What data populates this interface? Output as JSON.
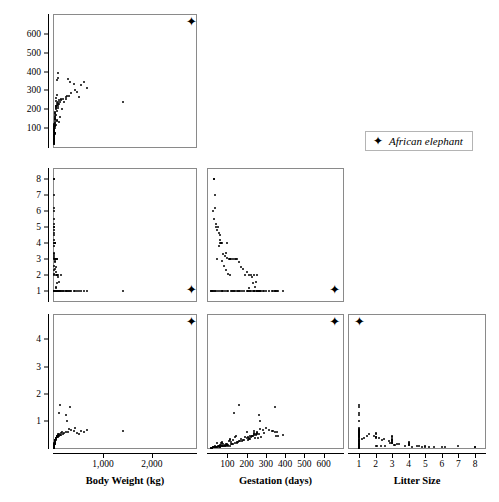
{
  "figure": {
    "type": "scatterplot-matrix",
    "legend": {
      "marker": "star-marker",
      "label": "African elephant"
    }
  },
  "variables": {
    "body_weight": {
      "label": "Body Weight (kg)",
      "ticks": [
        "1,000",
        "2,000"
      ],
      "tick_values": [
        1000,
        2000
      ],
      "range": [
        0,
        2900
      ]
    },
    "gestation": {
      "label": "Gestation (days)",
      "ticks": [
        "100",
        "200",
        "300",
        "400",
        "500",
        "600"
      ],
      "tick_values": [
        100,
        200,
        300,
        400,
        500,
        600
      ],
      "range": [
        0,
        700
      ]
    },
    "litter_size": {
      "label": "Litter Size",
      "ticks": [
        "1",
        "2",
        "3",
        "4",
        "5",
        "6",
        "7",
        "8"
      ],
      "tick_values": [
        1,
        2,
        3,
        4,
        5,
        6,
        7,
        8
      ],
      "range": [
        0.4,
        8.6
      ]
    },
    "brain_weight": {
      "label": "Brain Weight (g)",
      "ticks": [
        "1",
        "2",
        "3",
        "4"
      ],
      "tick_values": [
        1,
        2,
        3,
        4
      ],
      "range": [
        0,
        4.9
      ]
    }
  },
  "chart_data": {
    "type": "scatter",
    "title": "",
    "grid": false,
    "legend_position": "top-right",
    "panels": [
      {
        "name": "gestation-vs-bodyweight",
        "row": 0,
        "col": 0,
        "x": "body_weight",
        "y": "gestation",
        "xlabel": "Body Weight (kg)",
        "ylabel": "Gestation (days)"
      },
      {
        "name": "littersize-vs-bodyweight",
        "row": 1,
        "col": 0,
        "x": "body_weight",
        "y": "litter_size",
        "xlabel": "Body Weight (kg)",
        "ylabel": "Litter Size"
      },
      {
        "name": "littersize-vs-gestation",
        "row": 1,
        "col": 1,
        "x": "gestation",
        "y": "litter_size",
        "xlabel": "Gestation (days)",
        "ylabel": "Litter Size"
      },
      {
        "name": "brainweight-vs-bodyweight",
        "row": 2,
        "col": 0,
        "x": "body_weight",
        "y": "brain_weight",
        "xlabel": "Body Weight (kg)",
        "ylabel": "Brain Weight (g)"
      },
      {
        "name": "brainweight-vs-gestation",
        "row": 2,
        "col": 1,
        "x": "gestation",
        "y": "brain_weight",
        "xlabel": "Gestation (days)",
        "ylabel": "Brain Weight (g)"
      },
      {
        "name": "brainweight-vs-littersize",
        "row": 2,
        "col": 2,
        "x": "litter_size",
        "y": "brain_weight",
        "xlabel": "Litter Size",
        "ylabel": "Brain Weight (g)"
      }
    ],
    "highlight": {
      "label": "African elephant",
      "body_weight": 2800,
      "gestation": 655,
      "litter_size": 1,
      "brain_weight": 4.6
    },
    "observations": [
      {
        "body_weight": 6.8,
        "gestation": 45,
        "litter_size": 3,
        "brain_weight": 0.18
      },
      {
        "body_weight": 1.0,
        "gestation": 33,
        "litter_size": 8,
        "brain_weight": 0.04
      },
      {
        "body_weight": 3.4,
        "gestation": 38,
        "litter_size": 7,
        "brain_weight": 0.06
      },
      {
        "body_weight": 2.0,
        "gestation": 28,
        "litter_size": 6,
        "brain_weight": 0.03
      },
      {
        "body_weight": 1.7,
        "gestation": 31,
        "litter_size": 5.5,
        "brain_weight": 0.03
      },
      {
        "body_weight": 2.4,
        "gestation": 42,
        "litter_size": 5,
        "brain_weight": 0.05
      },
      {
        "body_weight": 2.6,
        "gestation": 50,
        "litter_size": 5,
        "brain_weight": 0.07
      },
      {
        "body_weight": 4.1,
        "gestation": 56,
        "litter_size": 4.6,
        "brain_weight": 0.08
      },
      {
        "body_weight": 3.8,
        "gestation": 60,
        "litter_size": 4.5,
        "brain_weight": 0.07
      },
      {
        "body_weight": 9.0,
        "gestation": 63,
        "litter_size": 4,
        "brain_weight": 0.12
      },
      {
        "body_weight": 14.0,
        "gestation": 68,
        "litter_size": 4,
        "brain_weight": 0.17
      },
      {
        "body_weight": 22.0,
        "gestation": 72,
        "litter_size": 4,
        "brain_weight": 0.22
      },
      {
        "body_weight": 6.0,
        "gestation": 66,
        "litter_size": 4,
        "brain_weight": 0.1
      },
      {
        "body_weight": 11.0,
        "gestation": 100,
        "litter_size": 4,
        "brain_weight": 0.14
      },
      {
        "body_weight": 5.2,
        "gestation": 58,
        "litter_size": 3.8,
        "brain_weight": 0.09
      },
      {
        "body_weight": 8.5,
        "gestation": 95,
        "litter_size": 3.4,
        "brain_weight": 0.13
      },
      {
        "body_weight": 18.0,
        "gestation": 110,
        "litter_size": 3,
        "brain_weight": 0.25
      },
      {
        "body_weight": 30.0,
        "gestation": 112,
        "litter_size": 3,
        "brain_weight": 0.3
      },
      {
        "body_weight": 42.0,
        "gestation": 115,
        "litter_size": 3,
        "brain_weight": 0.34
      },
      {
        "body_weight": 16.0,
        "gestation": 120,
        "litter_size": 3,
        "brain_weight": 0.21
      },
      {
        "body_weight": 25.0,
        "gestation": 130,
        "litter_size": 3,
        "brain_weight": 0.28
      },
      {
        "body_weight": 55.0,
        "gestation": 138,
        "litter_size": 3,
        "brain_weight": 0.4
      },
      {
        "body_weight": 70.0,
        "gestation": 145,
        "litter_size": 3,
        "brain_weight": 0.44
      },
      {
        "body_weight": 12.0,
        "gestation": 150,
        "litter_size": 3,
        "brain_weight": 0.2
      },
      {
        "body_weight": 20.0,
        "gestation": 160,
        "litter_size": 2.8,
        "brain_weight": 0.26
      },
      {
        "body_weight": 33.0,
        "gestation": 170,
        "litter_size": 2.5,
        "brain_weight": 0.33
      },
      {
        "body_weight": 28.0,
        "gestation": 180,
        "litter_size": 2.4,
        "brain_weight": 0.31
      },
      {
        "body_weight": 48.0,
        "gestation": 200,
        "litter_size": 2.2,
        "brain_weight": 0.38
      },
      {
        "body_weight": 60.0,
        "gestation": 225,
        "litter_size": 2,
        "brain_weight": 0.42
      },
      {
        "body_weight": 90.0,
        "gestation": 240,
        "litter_size": 2,
        "brain_weight": 0.5
      },
      {
        "body_weight": 150.0,
        "gestation": 255,
        "litter_size": 2,
        "brain_weight": 0.55
      },
      {
        "body_weight": 38.0,
        "gestation": 210,
        "litter_size": 2,
        "brain_weight": 0.36
      },
      {
        "body_weight": 52.0,
        "gestation": 190,
        "litter_size": 2,
        "brain_weight": 0.39
      },
      {
        "body_weight": 78.0,
        "gestation": 230,
        "litter_size": 1.9,
        "brain_weight": 0.46
      },
      {
        "body_weight": 110.0,
        "gestation": 250,
        "litter_size": 1.6,
        "brain_weight": 0.52
      },
      {
        "body_weight": 65.0,
        "gestation": 235,
        "litter_size": 1.5,
        "brain_weight": 0.43
      },
      {
        "body_weight": 45.0,
        "gestation": 245,
        "litter_size": 1.3,
        "brain_weight": 0.37
      },
      {
        "body_weight": 35.0,
        "gestation": 215,
        "litter_size": 1.2,
        "brain_weight": 0.32
      },
      {
        "body_weight": 100.0,
        "gestation": 135,
        "litter_size": 1,
        "brain_weight": 1.3
      },
      {
        "body_weight": 130.0,
        "gestation": 160,
        "litter_size": 1,
        "brain_weight": 1.6
      },
      {
        "body_weight": 170.0,
        "gestation": 200,
        "litter_size": 1,
        "brain_weight": 0.6
      },
      {
        "body_weight": 200.0,
        "gestation": 240,
        "litter_size": 1,
        "brain_weight": 0.55
      },
      {
        "body_weight": 250.0,
        "gestation": 255,
        "litter_size": 1,
        "brain_weight": 0.6
      },
      {
        "body_weight": 300.0,
        "gestation": 270,
        "litter_size": 1,
        "brain_weight": 0.7
      },
      {
        "body_weight": 340.0,
        "gestation": 285,
        "litter_size": 1,
        "brain_weight": 0.66
      },
      {
        "body_weight": 420.0,
        "gestation": 300,
        "litter_size": 1,
        "brain_weight": 0.75
      },
      {
        "body_weight": 460.0,
        "gestation": 290,
        "litter_size": 1,
        "brain_weight": 0.55
      },
      {
        "body_weight": 520.0,
        "gestation": 265,
        "litter_size": 1,
        "brain_weight": 0.5
      },
      {
        "body_weight": 560.0,
        "gestation": 330,
        "litter_size": 1,
        "brain_weight": 0.62
      },
      {
        "body_weight": 620.0,
        "gestation": 345,
        "litter_size": 1,
        "brain_weight": 0.58
      },
      {
        "body_weight": 1400.0,
        "gestation": 240,
        "litter_size": 1,
        "brain_weight": 0.62
      },
      {
        "body_weight": 680.0,
        "gestation": 315,
        "litter_size": 1,
        "brain_weight": 0.68
      },
      {
        "body_weight": 85.0,
        "gestation": 390,
        "litter_size": 1,
        "brain_weight": 0.48
      },
      {
        "body_weight": 75.0,
        "gestation": 365,
        "litter_size": 1,
        "brain_weight": 0.45
      },
      {
        "body_weight": 62.0,
        "gestation": 355,
        "litter_size": 1,
        "brain_weight": 0.44
      },
      {
        "body_weight": 58.0,
        "gestation": 275,
        "litter_size": 1,
        "brain_weight": 0.41
      },
      {
        "body_weight": 50.0,
        "gestation": 260,
        "litter_size": 1,
        "brain_weight": 0.38
      },
      {
        "body_weight": 40.0,
        "gestation": 220,
        "litter_size": 1,
        "brain_weight": 0.35
      },
      {
        "body_weight": 31.0,
        "gestation": 205,
        "litter_size": 1,
        "brain_weight": 0.31
      },
      {
        "body_weight": 27.0,
        "gestation": 185,
        "litter_size": 1,
        "brain_weight": 0.29
      },
      {
        "body_weight": 23.0,
        "gestation": 175,
        "litter_size": 1,
        "brain_weight": 0.27
      },
      {
        "body_weight": 19.0,
        "gestation": 165,
        "litter_size": 1,
        "brain_weight": 0.24
      },
      {
        "body_weight": 17.0,
        "gestation": 155,
        "litter_size": 1,
        "brain_weight": 0.23
      },
      {
        "body_weight": 15.0,
        "gestation": 148,
        "litter_size": 1,
        "brain_weight": 0.21
      },
      {
        "body_weight": 13.0,
        "gestation": 142,
        "litter_size": 1,
        "brain_weight": 0.19
      },
      {
        "body_weight": 10.5,
        "gestation": 128,
        "litter_size": 1,
        "brain_weight": 0.16
      },
      {
        "body_weight": 9.5,
        "gestation": 122,
        "litter_size": 1,
        "brain_weight": 0.15
      },
      {
        "body_weight": 8.0,
        "gestation": 118,
        "litter_size": 1,
        "brain_weight": 0.13
      },
      {
        "body_weight": 7.2,
        "gestation": 105,
        "litter_size": 1,
        "brain_weight": 0.12
      },
      {
        "body_weight": 5.8,
        "gestation": 98,
        "litter_size": 1,
        "brain_weight": 0.1
      },
      {
        "body_weight": 4.6,
        "gestation": 88,
        "litter_size": 1,
        "brain_weight": 0.09
      },
      {
        "body_weight": 3.9,
        "gestation": 80,
        "litter_size": 1,
        "brain_weight": 0.08
      },
      {
        "body_weight": 3.1,
        "gestation": 75,
        "litter_size": 1,
        "brain_weight": 0.07
      },
      {
        "body_weight": 2.8,
        "gestation": 70,
        "litter_size": 1,
        "brain_weight": 0.06
      },
      {
        "body_weight": 2.2,
        "gestation": 64,
        "litter_size": 1,
        "brain_weight": 0.05
      },
      {
        "body_weight": 1.5,
        "gestation": 52,
        "litter_size": 1,
        "brain_weight": 0.04
      },
      {
        "body_weight": 1.2,
        "gestation": 40,
        "litter_size": 1,
        "brain_weight": 0.035
      },
      {
        "body_weight": 0.8,
        "gestation": 35,
        "litter_size": 1,
        "brain_weight": 0.03
      },
      {
        "body_weight": 0.5,
        "gestation": 30,
        "litter_size": 1,
        "brain_weight": 0.02
      },
      {
        "body_weight": 0.3,
        "gestation": 25,
        "litter_size": 1,
        "brain_weight": 0.02
      },
      {
        "body_weight": 0.2,
        "gestation": 22,
        "litter_size": 1,
        "brain_weight": 0.015
      },
      {
        "body_weight": 0.15,
        "gestation": 20,
        "litter_size": 1,
        "brain_weight": 0.012
      },
      {
        "body_weight": 0.1,
        "gestation": 18,
        "litter_size": 1,
        "brain_weight": 0.01
      },
      {
        "body_weight": 0.06,
        "gestation": 16,
        "litter_size": 1,
        "brain_weight": 0.008
      },
      {
        "body_weight": 260.0,
        "gestation": 270,
        "litter_size": 1,
        "brain_weight": 1.0
      },
      {
        "body_weight": 180.0,
        "gestation": 255,
        "litter_size": 1,
        "brain_weight": 0.52
      },
      {
        "body_weight": 140.0,
        "gestation": 248,
        "litter_size": 1,
        "brain_weight": 0.49
      },
      {
        "body_weight": 120.0,
        "gestation": 238,
        "litter_size": 1,
        "brain_weight": 0.47
      },
      {
        "body_weight": 96.0,
        "gestation": 226,
        "litter_size": 1,
        "brain_weight": 0.45
      },
      {
        "body_weight": 88.0,
        "gestation": 218,
        "litter_size": 1,
        "brain_weight": 0.43
      },
      {
        "body_weight": 72.0,
        "gestation": 208,
        "litter_size": 1,
        "brain_weight": 0.4
      },
      {
        "body_weight": 5.0,
        "gestation": 112,
        "litter_size": 2,
        "brain_weight": 0.09
      },
      {
        "body_weight": 4.4,
        "gestation": 104,
        "litter_size": 2.1,
        "brain_weight": 0.08
      },
      {
        "body_weight": 3.6,
        "gestation": 92,
        "litter_size": 2.3,
        "brain_weight": 0.07
      },
      {
        "body_weight": 2.9,
        "gestation": 84,
        "litter_size": 2.6,
        "brain_weight": 0.06
      },
      {
        "body_weight": 6.4,
        "gestation": 96,
        "litter_size": 3.1,
        "brain_weight": 0.11
      },
      {
        "body_weight": 7.8,
        "gestation": 86,
        "litter_size": 3.2,
        "brain_weight": 0.12
      },
      {
        "body_weight": 9.8,
        "gestation": 78,
        "litter_size": 3.3,
        "brain_weight": 0.14
      },
      {
        "body_weight": 12.5,
        "gestation": 74,
        "litter_size": 2.9,
        "brain_weight": 0.18
      },
      {
        "body_weight": 2.1,
        "gestation": 62,
        "litter_size": 4.2,
        "brain_weight": 0.05
      },
      {
        "body_weight": 1.9,
        "gestation": 48,
        "litter_size": 4.8,
        "brain_weight": 0.04
      },
      {
        "body_weight": 1.3,
        "gestation": 44,
        "litter_size": 5.2,
        "brain_weight": 0.035
      },
      {
        "body_weight": 0.9,
        "gestation": 36,
        "litter_size": 6.2,
        "brain_weight": 0.03
      },
      {
        "body_weight": 0.7,
        "gestation": 30,
        "litter_size": 8,
        "brain_weight": 0.025
      },
      {
        "body_weight": 290.0,
        "gestation": 360,
        "litter_size": 1,
        "brain_weight": 0.58
      },
      {
        "body_weight": 410.0,
        "gestation": 335,
        "litter_size": 1,
        "brain_weight": 0.64
      },
      {
        "body_weight": 330.0,
        "gestation": 345,
        "litter_size": 1,
        "brain_weight": 1.5
      },
      {
        "body_weight": 240.0,
        "gestation": 265,
        "litter_size": 1,
        "brain_weight": 1.2
      }
    ]
  }
}
